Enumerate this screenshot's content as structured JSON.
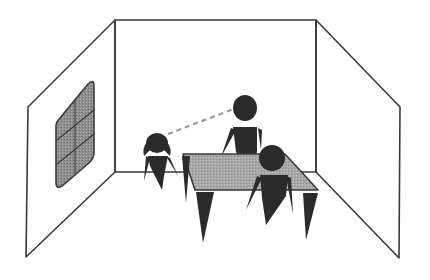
{
  "figure": {
    "colors": {
      "background": "#ffffff",
      "line": "#3a3a3a",
      "figure": "#2b2b2b",
      "table_top": "#a8a8a8",
      "window_fill": "#8f8f8f",
      "gaze_line": "#9a9a9a"
    },
    "room": {
      "back_wall": [
        [
          115,
          20
        ],
        [
          316,
          20
        ],
        [
          316,
          172
        ],
        [
          115,
          172
        ]
      ],
      "left_wall": [
        [
          115,
          20
        ],
        [
          28,
          107
        ],
        [
          26,
          257
        ],
        [
          115,
          172
        ]
      ],
      "right_wall": [
        [
          316,
          20
        ],
        [
          400,
          107
        ],
        [
          399,
          258
        ],
        [
          316,
          172
        ]
      ]
    },
    "window": {
      "label": "window-left-wall"
    },
    "table": {
      "top": [
        [
          183,
          154
        ],
        [
          285,
          154
        ],
        [
          318,
          190
        ],
        [
          195,
          190
        ]
      ]
    },
    "figures": [
      {
        "id": "child",
        "role": "seated-child-left"
      },
      {
        "id": "adult-standing",
        "role": "standing-adult-back"
      },
      {
        "id": "adult-front",
        "role": "seated-adult-front"
      }
    ],
    "gaze": {
      "from": "child",
      "to": "adult-standing",
      "style": "dashed"
    }
  }
}
